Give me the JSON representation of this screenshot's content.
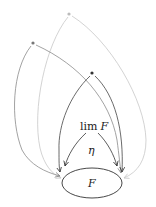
{
  "diagram": {
    "type": "commutative-diagram",
    "nodes": [
      {
        "id": "apex_light",
        "label": "",
        "shape": "dot",
        "color": "#bbbbbb"
      },
      {
        "id": "apex_mid",
        "label": "",
        "shape": "dot",
        "color": "#777777"
      },
      {
        "id": "apex_dark",
        "label": "",
        "shape": "dot",
        "color": "#333333"
      },
      {
        "id": "limit",
        "label_main": "lim",
        "label_var": "F"
      },
      {
        "id": "diagram_F",
        "label": "F",
        "shape": "ellipse"
      }
    ],
    "edges": [
      {
        "from": "apex_light",
        "to": "diagram_F",
        "side": "left",
        "color": "#c8c8c8"
      },
      {
        "from": "apex_light",
        "to": "diagram_F",
        "side": "right",
        "color": "#c8c8c8"
      },
      {
        "from": "apex_mid",
        "to": "diagram_F",
        "side": "left",
        "color": "#8a8a8a"
      },
      {
        "from": "apex_mid",
        "to": "diagram_F",
        "side": "right",
        "color": "#8a8a8a"
      },
      {
        "from": "apex_dark",
        "to": "diagram_F",
        "side": "left",
        "color": "#444444"
      },
      {
        "from": "apex_dark",
        "to": "diagram_F",
        "side": "right",
        "color": "#444444"
      },
      {
        "from": "limit",
        "to": "diagram_F",
        "side": "left",
        "color": "#333333"
      },
      {
        "from": "limit",
        "to": "diagram_F",
        "side": "right",
        "color": "#333333"
      }
    ],
    "labels": {
      "limit_main": "lim",
      "limit_var": "F",
      "natural_transformation": "η",
      "diagram": "F"
    }
  }
}
